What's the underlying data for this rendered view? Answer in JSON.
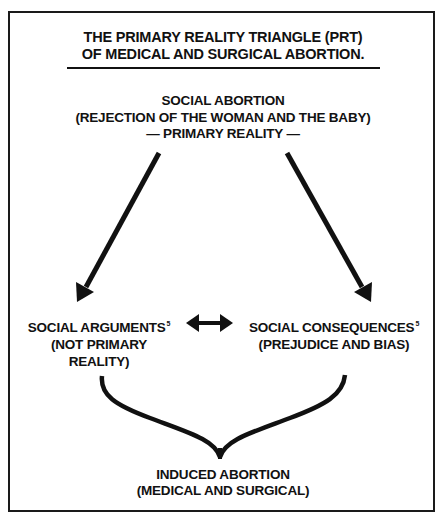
{
  "diagram": {
    "title": {
      "line1": "THE PRIMARY REALITY TRIANGLE (PRT)",
      "line2": "OF MEDICAL AND SURGICAL ABORTION."
    },
    "nodes": {
      "top": {
        "line1": "SOCIAL ABORTION",
        "line2": "(REJECTION OF THE WOMAN AND THE BABY)",
        "line3": "— PRIMARY REALITY —"
      },
      "left": {
        "label": "SOCIAL ARGUMENTS",
        "footnote": "5",
        "line2": "(NOT PRIMARY",
        "line3": "REALITY)"
      },
      "right": {
        "label": "SOCIAL CONSEQUENCES",
        "footnote": "5",
        "line2": "(PREJUDICE AND BIAS)"
      },
      "bottom": {
        "line1": "INDUCED ABORTION",
        "line2": "(MEDICAL AND SURGICAL)"
      }
    },
    "edges": [
      {
        "from": "top",
        "to": "left",
        "type": "arrow"
      },
      {
        "from": "top",
        "to": "right",
        "type": "arrow"
      },
      {
        "from": "left",
        "to": "right",
        "type": "bidirectional-arrow"
      },
      {
        "from": [
          "left",
          "right"
        ],
        "to": "bottom",
        "type": "brace"
      }
    ],
    "colors": {
      "stroke": "#111111",
      "background": "#ffffff"
    }
  }
}
